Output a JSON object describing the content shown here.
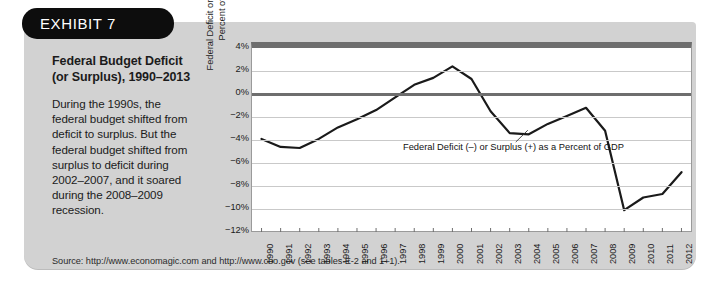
{
  "badge": {
    "label": "EXHIBIT 7"
  },
  "exhibit": {
    "title": "Federal Budget Deficit (or Surplus), 1990–2013",
    "body": "During the 1990s, the federal budget shifted from deficit to surplus. But the federal budget shifted from surplus to deficit during 2002–2007, and it soared during the 2008–2009 recession.",
    "source": "Source: http://www.economagic.com and http://www.cbo.gov (see tables E-2 and 1–1)."
  },
  "chart_data": {
    "type": "line",
    "title": "",
    "xlabel": "",
    "ylabel": "Federal Deficit or Surplus as a Percent of GDP",
    "ylabel_line1": "Federal Deficit or Surplus as a",
    "ylabel_line2": "Percent of GDP",
    "annotation": "Federal Deficit (–) or Surplus (+) as a Percent of GDP",
    "ylim": [
      -12,
      4
    ],
    "ytick_labels": [
      "4%",
      "2%",
      "0%",
      "−2%",
      "−4%",
      "−6%",
      "−8%",
      "−10%",
      "−12%"
    ],
    "ytick_values": [
      4,
      2,
      0,
      -2,
      -4,
      -6,
      -8,
      -10,
      -12
    ],
    "grid": true,
    "legend": "none",
    "x": [
      "1990",
      "1991",
      "1992",
      "1993",
      "1994",
      "1995",
      "1996",
      "1997",
      "1998",
      "1999",
      "2000",
      "2001",
      "2002",
      "2003",
      "2004",
      "2005",
      "2006",
      "2007",
      "2008",
      "2009",
      "2010",
      "2011",
      "2012"
    ],
    "categories": [
      "1990",
      "1991",
      "1992",
      "1993",
      "1994",
      "1995",
      "1996",
      "1997",
      "1998",
      "1999",
      "2000",
      "2001",
      "2002",
      "2003",
      "2004",
      "2005",
      "2006",
      "2007",
      "2008",
      "2009",
      "2010",
      "2011",
      "2012"
    ],
    "values": [
      -3.9,
      -4.6,
      -4.7,
      -3.9,
      -2.9,
      -2.2,
      -1.4,
      -0.3,
      0.8,
      1.4,
      2.4,
      1.3,
      -1.5,
      -3.4,
      -3.5,
      -2.6,
      -1.9,
      -1.2,
      -3.2,
      -10.1,
      -9.0,
      -8.7,
      -6.8
    ],
    "series": [
      {
        "name": "Federal Deficit (–) or Surplus (+) as a Percent of GDP",
        "values": [
          -3.9,
          -4.6,
          -4.7,
          -3.9,
          -2.9,
          -2.2,
          -1.4,
          -0.3,
          0.8,
          1.4,
          2.4,
          1.3,
          -1.5,
          -3.4,
          -3.5,
          -2.6,
          -1.9,
          -1.2,
          -3.2,
          -10.1,
          -9.0,
          -8.7,
          -6.8
        ]
      }
    ],
    "line_color": "#1a1a1a"
  }
}
